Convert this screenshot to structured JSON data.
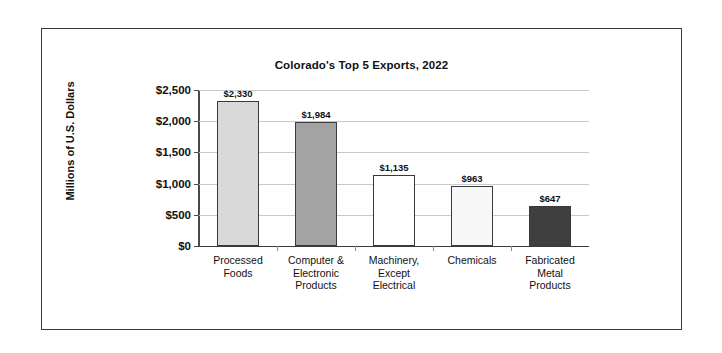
{
  "chart_data": {
    "type": "bar",
    "title": "Colorado's Top 5 Exports, 2022",
    "xlabel": "",
    "ylabel": "Millions of U.S. Dollars",
    "categories": [
      "Processed\nFoods",
      "Computer &\nElectronic\nProducts",
      "Machinery,\nExcept\nElectrical",
      "Chemicals",
      "Fabricated\nMetal\nProducts"
    ],
    "values": [
      2330,
      1984,
      1135,
      963,
      647
    ],
    "value_labels": [
      "$2,330",
      "$1,984",
      "$1,135",
      "$963",
      "$647"
    ],
    "bar_colors": [
      "#d9d9d9",
      "#a3a3a3",
      "#ffffff",
      "#f7f7f7",
      "#3f3f3f"
    ],
    "bar_edge_color": "#3a3a3a",
    "ylim": [
      0,
      2500
    ],
    "yticks": [
      0,
      500,
      1000,
      1500,
      2000,
      2500
    ],
    "ytick_labels": [
      "$0",
      "$500",
      "$1,000",
      "$1,500",
      "$2,000",
      "$2,500"
    ],
    "grid": "horizontal",
    "legend": "none"
  }
}
